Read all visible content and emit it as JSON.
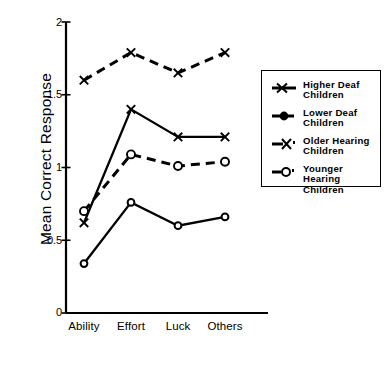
{
  "chart_data": {
    "type": "line",
    "title": "",
    "xlabel": "",
    "ylabel": "Mean Correct Response",
    "categories": [
      "Ability",
      "Effort",
      "Luck",
      "Others"
    ],
    "ylim": [
      0,
      2
    ],
    "yticks": [
      "0",
      "0.5",
      "1",
      "1.5",
      "2"
    ],
    "ytick_values": [
      0,
      0.5,
      1,
      1.5,
      2
    ],
    "grid": false,
    "legend_position": "right-inside",
    "series": [
      {
        "name": "Higher Deaf\nChildren",
        "marker": "x",
        "linestyle": "dashed",
        "values": [
          1.6,
          1.79,
          1.65,
          1.79
        ]
      },
      {
        "name": "Lower Deaf\nChildren",
        "marker": "circle",
        "linestyle": "solid",
        "values": [
          0.34,
          0.76,
          0.6,
          0.66
        ]
      },
      {
        "name": "Older Hearing\nChildren",
        "marker": "x",
        "linestyle": "solid",
        "values": [
          0.62,
          1.4,
          1.21,
          1.21
        ]
      },
      {
        "name": "Younger\nHearing\nChildren",
        "marker": "open-circle",
        "linestyle": "dashed",
        "values": [
          0.7,
          1.09,
          1.01,
          1.04
        ]
      }
    ]
  },
  "axis": {
    "ylabel": "Mean Correct Response",
    "ytick_labels": [
      "2",
      "1.5",
      "1",
      "0.5",
      "0"
    ],
    "xtick_labels": [
      "Ability",
      "Effort",
      "Luck",
      "Others"
    ]
  },
  "legend": {
    "items": [
      {
        "label": "Higher Deaf\nChildren"
      },
      {
        "label": "Lower Deaf\nChildren"
      },
      {
        "label": "Older Hearing\nChildren"
      },
      {
        "label": "Younger\nHearing\nChildren"
      }
    ]
  },
  "style": {
    "line_color": "#000000",
    "background": "#ffffff"
  }
}
